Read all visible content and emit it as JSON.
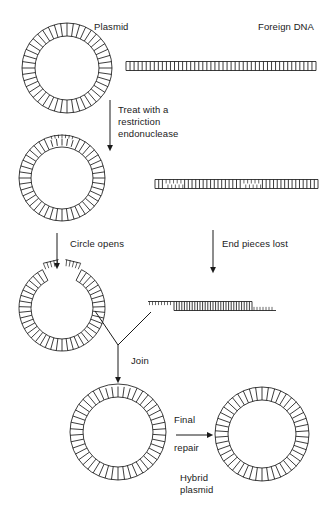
{
  "figure": {
    "type": "process-diagram",
    "background_color": "#ffffff",
    "stroke_color": "#1a1a1a",
    "text_color": "#1a1a1a"
  },
  "labels": {
    "plasmid": "Plasmid",
    "foreign_dna": "Foreign DNA",
    "treat_line1": "Treat with a",
    "treat_line2": "restriction",
    "treat_line3": "endonuclease",
    "circle_opens": "Circle opens",
    "end_pieces_lost": "End pieces lost",
    "join": "Join",
    "final": "Final",
    "repair": "repair",
    "hybrid_line1": "Hybrid",
    "hybrid_line2": "plasmid"
  },
  "stages": [
    {
      "id": "stage-1",
      "name": "starting-materials",
      "elements": [
        {
          "kind": "plasmid-circle",
          "label": "Plasmid",
          "state": "closed-circular",
          "cx": 67,
          "cy": 68,
          "r_outer": 45,
          "r_inner": 32,
          "rungs": 44
        },
        {
          "kind": "dna-ladder",
          "label": "Foreign DNA",
          "state": "linear-intact",
          "x1": 126,
          "x2": 316,
          "y": 66,
          "rungs": 47
        }
      ]
    },
    {
      "id": "stage-2",
      "name": "after-restriction-digest",
      "arrow_label": "Treat with a restriction endonuclease",
      "elements": [
        {
          "kind": "plasmid-circle",
          "label": "",
          "state": "cut-circular",
          "cx": 62,
          "cy": 178,
          "r_outer": 43,
          "r_inner": 31,
          "rungs": 44
        },
        {
          "kind": "dna-ladder",
          "label": "",
          "state": "linear-cut-two-sites",
          "x1": 155,
          "x2": 318,
          "y": 184,
          "rungs": 44,
          "cut_sites": 2
        }
      ]
    },
    {
      "id": "stage-3",
      "name": "open-circle-and-fragment",
      "arrow_labels": [
        "Circle opens",
        "End pieces lost"
      ],
      "elements": [
        {
          "kind": "plasmid-open-c",
          "label": "",
          "state": "open-sticky-ends",
          "cx": 62,
          "cy": 308,
          "r_outer": 43,
          "r_inner": 31,
          "gap_degrees": 54
        },
        {
          "kind": "dna-ladder",
          "label": "",
          "state": "fragment-sticky-ends",
          "x1": 148,
          "x2": 276,
          "y": 306,
          "rungs": 30
        }
      ]
    },
    {
      "id": "stage-4",
      "name": "joined-and-repaired",
      "arrow_labels": [
        "Join",
        "Final repair"
      ],
      "elements": [
        {
          "kind": "plasmid-circle",
          "label": "",
          "state": "joined-nicked",
          "cx": 118,
          "cy": 432,
          "r_outer": 48,
          "r_inner": 35,
          "rungs": 46
        },
        {
          "kind": "plasmid-circle",
          "label": "Hybrid plasmid",
          "state": "hybrid-sealed",
          "cx": 262,
          "cy": 434,
          "r_outer": 47,
          "r_inner": 34,
          "rungs": 46
        }
      ]
    }
  ],
  "arrows": [
    {
      "name": "treat-arrow",
      "orientation": "vertical",
      "x": 110,
      "y1": 100,
      "y2": 150
    },
    {
      "name": "circle-opens-arrow",
      "orientation": "vertical",
      "x": 57,
      "y1": 233,
      "y2": 268
    },
    {
      "name": "end-pieces-lost-arrow",
      "orientation": "vertical",
      "x": 213,
      "y1": 230,
      "y2": 272
    },
    {
      "name": "join-arrow",
      "orientation": "vertical",
      "x": 118,
      "y1": 345,
      "y2": 382
    },
    {
      "name": "final-repair-arrow",
      "orientation": "horizontal",
      "y": 435,
      "x1": 176,
      "x2": 212
    }
  ]
}
